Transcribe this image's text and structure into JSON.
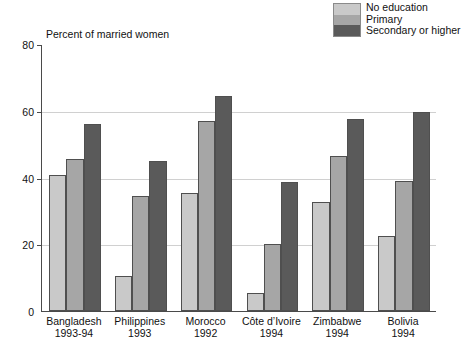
{
  "chart_data": {
    "type": "bar",
    "title": "Percent of married women",
    "xlabel": "",
    "ylabel": "",
    "ylim": [
      0,
      80
    ],
    "yticks": [
      0,
      20,
      40,
      60,
      80
    ],
    "grid": true,
    "legend_position": "top-right",
    "categories": [
      "Bangladesh",
      "Philippines",
      "Morocco",
      "Côte d’Ivoire",
      "Zimbabwe",
      "Bolivia"
    ],
    "category_years": [
      "1993-94",
      "1993",
      "1992",
      "1994",
      "1994",
      "1994"
    ],
    "series": [
      {
        "name": "No education",
        "color": "#c9c9c9",
        "values": [
          40.8,
          10.6,
          35.5,
          5.4,
          32.6,
          22.5
        ]
      },
      {
        "name": "Primary",
        "color": "#a6a6a6",
        "values": [
          45.4,
          34.5,
          57.0,
          20.0,
          46.4,
          39.0
        ]
      },
      {
        "name": "Secondary or higher",
        "color": "#5a5a5a",
        "values": [
          55.9,
          45.0,
          64.5,
          38.6,
          57.5,
          59.5
        ]
      }
    ]
  },
  "legend": {
    "items": [
      {
        "label": "No education",
        "color": "#c9c9c9"
      },
      {
        "label": "Primary",
        "color": "#a6a6a6"
      },
      {
        "label": "Secondary or higher",
        "color": "#5a5a5a"
      }
    ]
  },
  "axis": {
    "title": "Percent of married women",
    "y_tick_labels": [
      "80",
      "60",
      "40",
      "20",
      "0"
    ]
  }
}
